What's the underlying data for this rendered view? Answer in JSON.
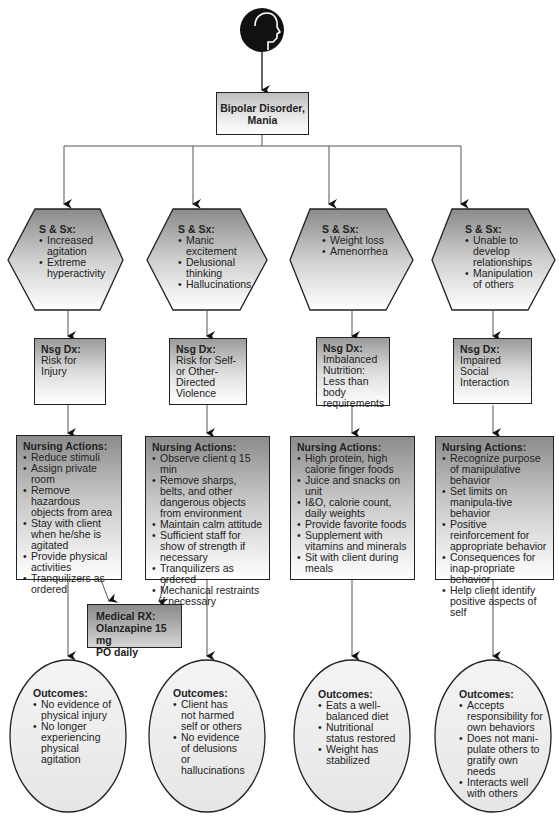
{
  "diagram": {
    "root_icon": "head-profile-icon",
    "main_node": {
      "line1": "Bipolar Disorder,",
      "line2": "Mania"
    },
    "medical_rx": {
      "title": "Medical RX:",
      "line1": "Olanzapine 15 mg",
      "line2": "PO daily"
    },
    "columns": [
      {
        "signs": {
          "title": "S & Sx:",
          "items": [
            "Increased agitation",
            "Extreme hyperactivity"
          ]
        },
        "nsg_dx": {
          "title": "Nsg Dx:",
          "text": "Risk for Injury"
        },
        "actions": {
          "title": "Nursing Actions:",
          "items": [
            "Reduce stimuli",
            "Assign private room",
            "Remove hazardous objects from area",
            "Stay with client when he/she is agitated",
            "Provide physical activities",
            "Tranquilizers as ordered"
          ]
        },
        "outcomes": {
          "title": "Outcomes:",
          "items": [
            "No evidence of physical injury",
            "No longer experiencing physical agitation"
          ]
        }
      },
      {
        "signs": {
          "title": "S & Sx:",
          "items": [
            "Manic excitement",
            "Delusional thinking",
            "Hallucinations"
          ]
        },
        "nsg_dx": {
          "title": "Nsg Dx:",
          "text": "Risk for Self- or Other-Directed Violence"
        },
        "actions": {
          "title": "Nursing Actions:",
          "items": [
            "Observe client q 15 min",
            "Remove sharps, belts, and other dangerous objects from environment",
            "Maintain calm attitude",
            "Sufficient staff for show of strength if necessary",
            "Tranquilizers as ordered",
            "Mechanical restraints if necessary"
          ]
        },
        "outcomes": {
          "title": "Outcomes:",
          "items": [
            "Client has not harmed self or others",
            "No evidence of delusions or hallucinations"
          ]
        }
      },
      {
        "signs": {
          "title": "S & Sx:",
          "items": [
            "Weight loss",
            "Amenorrhea"
          ]
        },
        "nsg_dx": {
          "title": "Nsg Dx:",
          "text": "Imbalanced Nutrition: Less than body requirements"
        },
        "actions": {
          "title": "Nursing Actions:",
          "items": [
            "High protein, high calorie finger foods",
            "Juice and snacks on unit",
            "I&O, calorie count, daily weights",
            "Provide favorite foods",
            "Supplement with vitamins and minerals",
            "Sit with client during meals"
          ]
        },
        "outcomes": {
          "title": "Outcomes:",
          "items": [
            "Eats a well-balanced diet",
            "Nutritional status restored",
            "Weight has stabilized"
          ]
        }
      },
      {
        "signs": {
          "title": "S & Sx:",
          "items": [
            "Unable to develop relationships",
            "Manipulation of others"
          ]
        },
        "nsg_dx": {
          "title": "Nsg Dx:",
          "text": "Impaired Social Interaction"
        },
        "actions": {
          "title": "Nursing Actions:",
          "items": [
            "Recognize purpose of manipulative behavior",
            "Set limits on manipula-tive behavior",
            "Positive reinforcement for appropriate behavior",
            "Consequences for inap-propriate behavior",
            "Help client identify positive aspects of self"
          ]
        },
        "outcomes": {
          "title": "Outcomes:",
          "items": [
            "Accepts responsibility for own behaviors",
            "Does not mani-pulate others to gratify own needs",
            "Interacts well with others"
          ]
        }
      }
    ]
  }
}
